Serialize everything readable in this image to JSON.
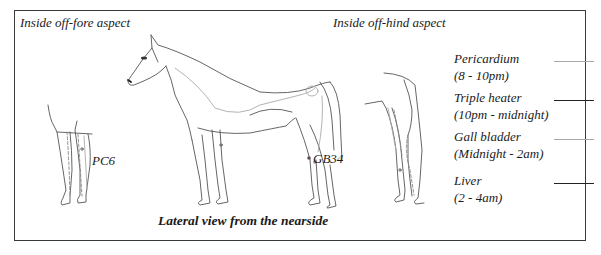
{
  "diagram": {
    "views": {
      "fore": "Inside off-fore aspect",
      "hind": "Inside off-hind aspect",
      "lateral": "Lateral view from the nearside"
    },
    "points": {
      "pc6": "PC6",
      "gb34": "GB34"
    },
    "legend": [
      {
        "name": "Pericardium",
        "time": "(8 - 10pm)",
        "line_color": "#a8a8a8",
        "line_style": "light"
      },
      {
        "name": "Triple heater",
        "time": "(10pm - midnight)",
        "line_color": "#222222",
        "line_style": "dark"
      },
      {
        "name": "Gall bladder",
        "time": "(Midnight - 2am)",
        "line_color": "#a8a8a8",
        "line_style": "light"
      },
      {
        "name": "Liver",
        "time": "(2 - 4am)",
        "line_color": "#222222",
        "line_style": "dark"
      }
    ]
  }
}
